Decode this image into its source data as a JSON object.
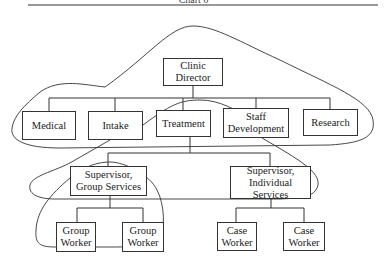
{
  "chart_title": "Chart 6",
  "nodes": {
    "director": "Clinic Director",
    "medical": "Medical",
    "intake": "Intake",
    "treatment": "Treatment",
    "staff_development": "Staff Development",
    "research": "Research",
    "supervisor_group": "Supervisor, Group Services",
    "supervisor_individual": "Supervisor, Individual Services",
    "group_worker_1": "Group Worker",
    "group_worker_2": "Group Worker",
    "case_worker_1": "Case Worker",
    "case_worker_2": "Case Worker"
  },
  "edges": [
    [
      "director",
      "medical"
    ],
    [
      "director",
      "intake"
    ],
    [
      "director",
      "treatment"
    ],
    [
      "director",
      "staff_development"
    ],
    [
      "director",
      "research"
    ],
    [
      "treatment",
      "supervisor_group"
    ],
    [
      "treatment",
      "supervisor_individual"
    ],
    [
      "supervisor_group",
      "group_worker_1"
    ],
    [
      "supervisor_group",
      "group_worker_2"
    ],
    [
      "supervisor_individual",
      "case_worker_1"
    ],
    [
      "supervisor_individual",
      "case_worker_2"
    ]
  ],
  "groupings": [
    "outer boundary around director and department level",
    "inner boundary from Intake through Staff Development enclosing supervisors",
    "boundary around Group Services team"
  ]
}
